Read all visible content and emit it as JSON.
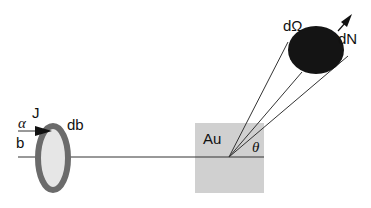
{
  "labels": {
    "alpha": "α",
    "impact_parameter": "b",
    "flux": "J",
    "ring_width": "db",
    "target": "Au",
    "scattering_angle": "θ",
    "solid_angle": "dΩ",
    "scattered_count": "dN"
  },
  "colors": {
    "ring": "#6b6b6b",
    "ring_fill": "#e6e6e6",
    "target": "#d0d0d0",
    "detector": "#141414",
    "line": "#333333"
  }
}
